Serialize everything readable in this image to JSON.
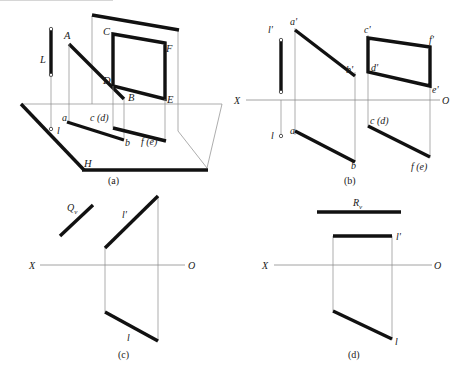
{
  "figure": {
    "captions": {
      "a": "(a)",
      "b": "(b)",
      "c": "(c)",
      "d": "(d)"
    },
    "colors": {
      "ink": "#111111",
      "thin_line": "#8a8a8a",
      "background": "#ffffff"
    },
    "panel_a": {
      "caption": "(a)",
      "description": "Pictorial view of H and V projection planes with line AB, plane CDEF and vertical line L",
      "labels": {
        "L": "L",
        "A": "A",
        "B": "B",
        "C": "C",
        "D": "D",
        "E": "E",
        "F": "F",
        "H": "H",
        "a": "a",
        "b": "b",
        "l": "l",
        "cd": "c (d)",
        "fe": "f (e)"
      }
    },
    "panel_b": {
      "caption": "(b)",
      "description": "Two-view orthographic projection of line AB, plane CDEF and line L",
      "axis": {
        "left": "X",
        "right": "O"
      },
      "labels": {
        "l_prime": "l'",
        "a_prime": "a'",
        "b_prime": "b'",
        "c_prime": "c'",
        "d_prime": "d'",
        "e_prime": "e'",
        "f_prime": "f'",
        "l": "l",
        "a": "a",
        "b": "b",
        "cd": "c (d)",
        "fe": "f (e)"
      }
    },
    "panel_c": {
      "caption": "(c)",
      "description": "Projection of line l with oblique trace Qv",
      "axis": {
        "left": "X",
        "right": "O"
      },
      "labels": {
        "Qv_base": "Q",
        "Qv_sub": "v",
        "l_prime": "l'",
        "l": "l"
      }
    },
    "panel_d": {
      "caption": "(d)",
      "description": "Projection of line l with horizontal trace Rv",
      "axis": {
        "left": "X",
        "right": "O"
      },
      "labels": {
        "Rv_base": "R",
        "Rv_sub": "v",
        "l_prime": "l'",
        "l": "l"
      }
    }
  }
}
